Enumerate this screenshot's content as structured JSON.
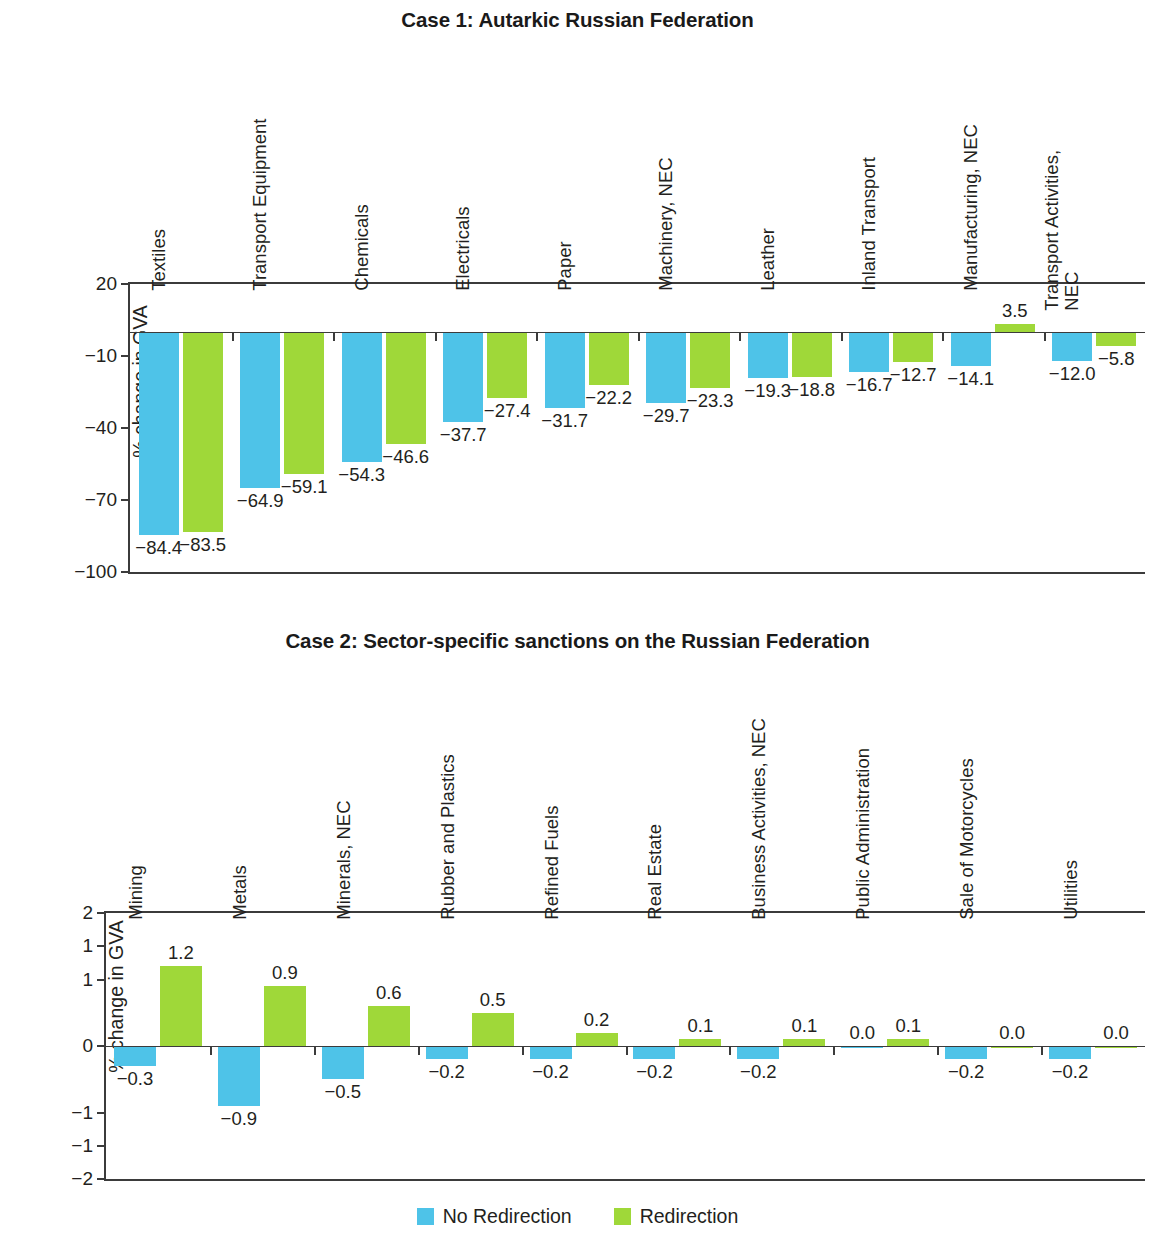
{
  "legend": {
    "items": [
      {
        "label": "No Redirection",
        "color": "#4ec3e8"
      },
      {
        "label": "Redirection",
        "color": "#9fd839"
      }
    ]
  },
  "colors": {
    "no_redirection": "#4ec3e8",
    "redirection": "#9fd839",
    "axis": "#3b3b3b",
    "text": "#231f20"
  },
  "chart_data": [
    {
      "type": "bar",
      "id": "case1",
      "title": "Case 1: Autarkic Russian Federation",
      "xlabel": "",
      "ylabel": "% change in GVA",
      "ylim": [
        -100,
        20
      ],
      "yticks": [
        20,
        -10,
        -40,
        -70,
        -100
      ],
      "ytick_labels": [
        "20",
        "-10",
        "-40",
        "-70",
        "-100"
      ],
      "grid": false,
      "legend_position": "bottom",
      "categories": [
        "Textiles",
        "Transport Equipment",
        "Chemicals",
        "Electricals",
        "Paper",
        "Machinery, NEC",
        "Leather",
        "Inland Transport",
        "Manufacturing, NEC",
        "Transport Activities, NEC"
      ],
      "series": [
        {
          "name": "No Redirection",
          "color": "#4ec3e8",
          "values": [
            -84.4,
            -64.9,
            -54.3,
            -37.7,
            -31.7,
            -29.7,
            -19.3,
            -16.7,
            -14.1,
            -12.0
          ],
          "labels": [
            "-84.4",
            "-64.9",
            "-54.3",
            "-37.7",
            "-31.7",
            "-29.7",
            "-19.3",
            "-16.7",
            "-14.1",
            "-12.0"
          ]
        },
        {
          "name": "Redirection",
          "color": "#9fd839",
          "values": [
            -83.5,
            -59.1,
            -46.6,
            -27.4,
            -22.2,
            -23.3,
            -18.8,
            -12.7,
            3.5,
            -5.8
          ],
          "labels": [
            "-83.5",
            "-59.1",
            "-46.6",
            "-27.4",
            "-22.2",
            "-23.3",
            "-18.8",
            "-12.7",
            "3.5",
            "-5.8"
          ]
        }
      ]
    },
    {
      "type": "bar",
      "id": "case2",
      "title": "Case 2: Sector-specific sanctions on the Russian Federation",
      "xlabel": "",
      "ylabel": "% change in GVA",
      "ylim": [
        -2,
        2
      ],
      "yticks": [
        2,
        1.5,
        1,
        0,
        -1,
        -1.5,
        -2
      ],
      "ytick_labels": [
        "2",
        "1",
        "1",
        "0",
        "-1",
        "-1",
        "-2"
      ],
      "grid": false,
      "legend_position": "bottom",
      "categories": [
        "Mining",
        "Metals",
        "Minerals, NEC",
        "Rubber and Plastics",
        "Refined Fuels",
        "Real Estate",
        "Business Activities, NEC",
        "Public Administration",
        "Sale of Motorcycles",
        "Utilities"
      ],
      "series": [
        {
          "name": "No Redirection",
          "color": "#4ec3e8",
          "values": [
            -0.3,
            -0.9,
            -0.5,
            -0.2,
            -0.2,
            -0.2,
            -0.2,
            0.0,
            -0.2,
            -0.2
          ],
          "labels": [
            "-0.3",
            "-0.9",
            "-0.5",
            "-0.2",
            "-0.2",
            "-0.2",
            "-0.2",
            "0.0",
            "-0.2",
            "-0.2"
          ]
        },
        {
          "name": "Redirection",
          "color": "#9fd839",
          "values": [
            1.2,
            0.9,
            0.6,
            0.5,
            0.2,
            0.1,
            0.1,
            0.1,
            0.0,
            0.0
          ],
          "labels": [
            "1.2",
            "0.9",
            "0.6",
            "0.5",
            "0.2",
            "0.1",
            "0.1",
            "0.1",
            "0.0",
            "0.0"
          ]
        }
      ]
    }
  ]
}
